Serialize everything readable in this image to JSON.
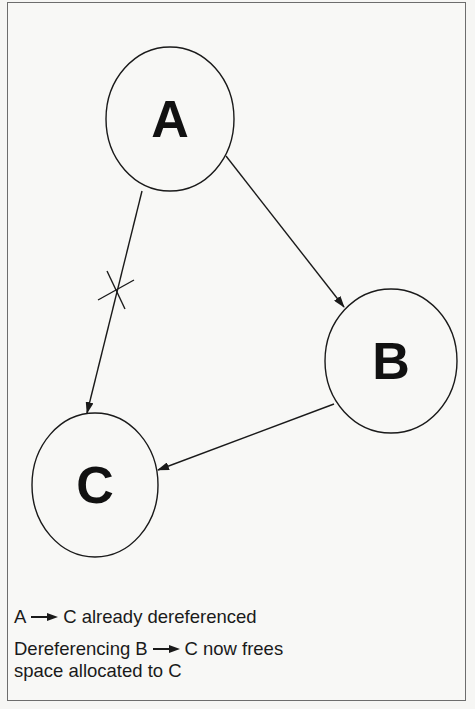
{
  "diagram": {
    "nodes": [
      {
        "id": "A",
        "label": "A",
        "cx": 170,
        "cy": 119,
        "rx": 64,
        "ry": 72
      },
      {
        "id": "B",
        "label": "B",
        "cx": 391,
        "cy": 361,
        "rx": 66,
        "ry": 72
      },
      {
        "id": "C",
        "label": "C",
        "cx": 95,
        "cy": 485,
        "rx": 63,
        "ry": 72
      }
    ],
    "edges": [
      {
        "from": "A",
        "to": "B",
        "x1": 226,
        "y1": 156,
        "x2": 344,
        "y2": 307,
        "crossed_out": false
      },
      {
        "from": "A",
        "to": "C",
        "x1": 142,
        "y1": 191,
        "x2": 87,
        "y2": 413,
        "crossed_out": true
      },
      {
        "from": "B",
        "to": "C",
        "x1": 334,
        "y1": 404,
        "x2": 158,
        "y2": 470,
        "crossed_out": false
      }
    ],
    "cross_mark": {
      "cx": 116,
      "cy": 290
    }
  },
  "legend": {
    "line1": {
      "from": "A",
      "to": "C",
      "text": "already dereferenced"
    },
    "line2": {
      "prefix": "Dereferencing",
      "from": "B",
      "to": "C",
      "text": "now frees"
    },
    "line3": {
      "text": "space allocated to C"
    }
  },
  "colors": {
    "stroke": "#1a1a1a",
    "background": "#f8f8f6",
    "border": "#6d6d6d"
  }
}
